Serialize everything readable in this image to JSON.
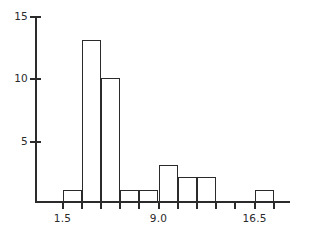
{
  "chart_data": {
    "type": "bar",
    "title": "",
    "subtitle": "",
    "xlabel": "",
    "ylabel": "",
    "grid": false,
    "legend": "none",
    "bin_width": 1.5,
    "bin_starts": [
      1.5,
      3.0,
      4.5,
      6.0,
      7.5,
      9.0,
      10.5,
      12.0,
      13.5,
      15.0,
      16.5
    ],
    "categories": [
      "1.5-3.0",
      "3.0-4.5",
      "4.5-6.0",
      "6.0-7.5",
      "7.5-9.0",
      "9.0-10.5",
      "10.5-12.0",
      "12.0-13.5",
      "13.5-15.0",
      "15.0-16.5",
      "16.5-18.0"
    ],
    "values": [
      1,
      13,
      10,
      1,
      1,
      3,
      2,
      2,
      0,
      0,
      1
    ],
    "xlim": [
      0.6,
      19.5
    ],
    "ylim": [
      0,
      15.5
    ],
    "x_ticks": [
      1.5,
      3.0,
      4.5,
      6.0,
      7.5,
      9.0,
      10.5,
      12.0,
      13.5,
      15.0,
      16.5,
      18.0
    ],
    "x_tick_labels": [
      "1.5",
      "",
      "",
      "",
      "",
      "9.0",
      "",
      "",
      "",
      "",
      "16.5",
      ""
    ],
    "y_ticks": [
      5,
      10,
      15
    ],
    "y_tick_labels": [
      "5",
      "10",
      "15"
    ],
    "colors": {
      "axis": "#2b2b2b",
      "bar_edge": "#2b2b2b",
      "bar_fill": "transparent",
      "background": "#ffffff",
      "text": "#2b2b2b"
    }
  }
}
